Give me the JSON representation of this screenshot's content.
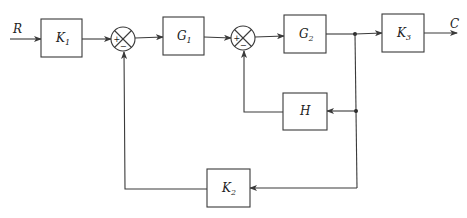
{
  "diagram": {
    "type": "block-diagram",
    "input": {
      "label": "R"
    },
    "output": {
      "label": "C"
    },
    "blocks": [
      {
        "id": "K1",
        "label": "K",
        "sub": "1"
      },
      {
        "id": "G1",
        "label": "G",
        "sub": "1"
      },
      {
        "id": "G2",
        "label": "G",
        "sub": "2"
      },
      {
        "id": "K3",
        "label": "K",
        "sub": "3"
      },
      {
        "id": "H",
        "label": "H",
        "sub": ""
      },
      {
        "id": "K2",
        "label": "K",
        "sub": "2"
      }
    ],
    "summing_junctions": [
      {
        "id": "S1",
        "plus": "+",
        "minus": "−"
      },
      {
        "id": "S2",
        "plus": "+",
        "minus": "−"
      }
    ],
    "connections": [
      "R -> K1",
      "K1 -> S1(+)",
      "S1 -> G1",
      "G1 -> S2(+)",
      "S2 -> G2",
      "G2 -> branch",
      "branch -> K3",
      "K3 -> C",
      "branch -> H",
      "H -> S2(-)",
      "branch -> K2",
      "K2 -> S1(-)"
    ]
  }
}
